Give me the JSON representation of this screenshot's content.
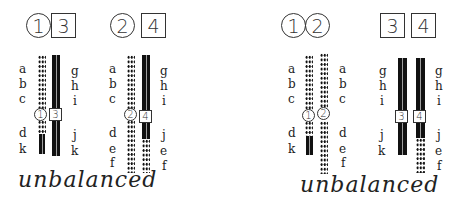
{
  "panels": [
    {
      "id": "left",
      "header": {
        "circle": "1",
        "square": "3",
        "circle2": "2",
        "square2": "4"
      },
      "pair_a": {
        "circle_marker": "1",
        "square_marker": "3",
        "left_labels": [
          "a",
          "b",
          "c",
          "d",
          "k"
        ],
        "right_labels": [
          "g",
          "h",
          "i",
          "j",
          "k"
        ]
      },
      "pair_b": {
        "circle_marker": "2",
        "square_marker": "4",
        "left_labels": [
          "a",
          "b",
          "c",
          "d",
          "e",
          "f"
        ],
        "right_labels": [
          "g",
          "h",
          "i",
          "j",
          "e",
          "f"
        ]
      },
      "caption": "unbalanced"
    },
    {
      "id": "right",
      "header": {
        "circle": "1",
        "circle2": "2",
        "square": "3",
        "square2": "4"
      },
      "pair_a": {
        "circle_marker": "1",
        "circle_marker2": "2",
        "left_labels": [
          "a",
          "b",
          "c",
          "d",
          "k"
        ],
        "right_labels": [
          "a",
          "b",
          "c",
          "d",
          "e",
          "f"
        ]
      },
      "pair_b": {
        "square_marker": "3",
        "square_marker2": "4",
        "left_labels": [
          "g",
          "h",
          "i",
          "j",
          "k"
        ],
        "right_labels": [
          "g",
          "h",
          "i",
          "j",
          "e",
          "f"
        ]
      },
      "caption": "unbalanced"
    }
  ],
  "colors": {
    "chromosome": "#111111",
    "outline": "#333333",
    "background": "#ffffff"
  }
}
